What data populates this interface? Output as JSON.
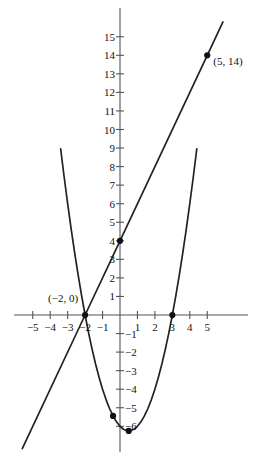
{
  "figure": {
    "kind": "cartesian-graph",
    "background_color": "#ffffff",
    "ink_color": "#222222",
    "axis_color": "#555555"
  },
  "axes": {
    "x_label": "",
    "y_label": "",
    "xlim": [
      -6.3,
      6.3
    ],
    "ylim": [
      -7.6,
      16.5
    ],
    "grid": false,
    "x_ticks": [
      -5,
      -4,
      -3,
      -2,
      -1,
      1,
      2,
      3,
      4,
      5
    ],
    "x_tick_labels": [
      "−5",
      "−4",
      "−3",
      "−2",
      "−1",
      "1",
      "2",
      "3",
      "4",
      "5"
    ],
    "y_ticks": [
      15,
      14,
      13,
      12,
      11,
      10,
      9,
      8,
      7,
      6,
      5,
      4,
      3,
      2,
      1,
      -1,
      -2,
      -3,
      -4,
      -5,
      -6
    ],
    "y_tick_labels": [
      "15",
      "14",
      "13",
      "12",
      "11",
      "10",
      "9",
      "8",
      "7",
      "6",
      "5",
      "4",
      "3",
      "2",
      "1",
      "−1",
      "−2",
      "−3",
      "−4",
      "−5",
      "−6"
    ],
    "origin_px": {
      "x": 120,
      "y": 315
    },
    "px_per_unit": {
      "x": 17.45,
      "y": 18.55
    }
  },
  "chart_data": {
    "type": "line",
    "title": "",
    "xlabel": "",
    "ylabel": "",
    "xlim": [
      -6.3,
      6.3
    ],
    "ylim": [
      -7.6,
      16.5
    ],
    "grid": false,
    "legend": "none",
    "series": [
      {
        "name": "parabola",
        "equation": "y = x^2 - x - 6",
        "kind": "quadratic",
        "coefficients": {
          "a": 1,
          "b": -1,
          "c": -6
        },
        "vertex": [
          0.5,
          -6.25
        ],
        "x_intercepts": [
          -2,
          3
        ],
        "y_intercept": -6,
        "x_domain": [
          -3.4,
          4.4
        ],
        "points": [
          [
            -3.4,
            8.96
          ],
          [
            -3.2,
            7.44
          ],
          [
            -3.0,
            6.0
          ],
          [
            -2.8,
            4.64
          ],
          [
            -2.6,
            3.36
          ],
          [
            -2.4,
            2.16
          ],
          [
            -2.2,
            1.04
          ],
          [
            -2.0,
            0.0
          ],
          [
            -1.8,
            -0.96
          ],
          [
            -1.6,
            -1.84
          ],
          [
            -1.4,
            -2.64
          ],
          [
            -1.2,
            -3.36
          ],
          [
            -1.0,
            -4.0
          ],
          [
            -0.8,
            -4.56
          ],
          [
            -0.6,
            -5.04
          ],
          [
            -0.4,
            -5.44
          ],
          [
            -0.2,
            -5.76
          ],
          [
            0.0,
            -6.0
          ],
          [
            0.2,
            -6.16
          ],
          [
            0.4,
            -6.24
          ],
          [
            0.5,
            -6.25
          ],
          [
            0.6,
            -6.24
          ],
          [
            0.8,
            -6.16
          ],
          [
            1.0,
            -6.0
          ],
          [
            1.2,
            -5.76
          ],
          [
            1.4,
            -5.44
          ],
          [
            1.6,
            -5.04
          ],
          [
            1.8,
            -4.56
          ],
          [
            2.0,
            -4.0
          ],
          [
            2.2,
            -3.36
          ],
          [
            2.4,
            -2.64
          ],
          [
            2.6,
            -1.84
          ],
          [
            2.8,
            -0.96
          ],
          [
            3.0,
            0.0
          ],
          [
            3.2,
            1.04
          ],
          [
            3.4,
            2.16
          ],
          [
            3.6,
            3.36
          ],
          [
            3.8,
            4.64
          ],
          [
            4.0,
            6.0
          ],
          [
            4.2,
            7.44
          ],
          [
            4.4,
            8.96
          ]
        ]
      },
      {
        "name": "line",
        "equation": "y = 2x + 4",
        "kind": "linear",
        "slope": 2,
        "y_intercept": 4,
        "x_intercept": -2,
        "x_domain": [
          -5.6,
          5.9
        ],
        "points": [
          [
            -5.6,
            -7.2
          ],
          [
            -2.0,
            0.0
          ],
          [
            0.0,
            4.0
          ],
          [
            5.0,
            14.0
          ],
          [
            5.9,
            15.8
          ]
        ]
      }
    ],
    "intersections": [
      {
        "label": "(−2, 0)",
        "x": -2,
        "y": 0
      },
      {
        "label": "(5, 14)",
        "x": 5,
        "y": 14
      }
    ],
    "marked_points": [
      {
        "name": "intersection-left",
        "x": -2,
        "y": 0,
        "label": "(−2, 0)"
      },
      {
        "name": "intersection-right",
        "x": 5,
        "y": 14,
        "label": "(5, 14)"
      },
      {
        "name": "line-y-intercept",
        "x": 0,
        "y": 4,
        "label": ""
      },
      {
        "name": "parabola-x-intercept-right",
        "x": 3,
        "y": 0,
        "label": ""
      },
      {
        "name": "parabola-point-left-of-vertex",
        "x": -0.4,
        "y": -5.44,
        "label": ""
      },
      {
        "name": "parabola-vertex",
        "x": 0.5,
        "y": -6.25,
        "label": ""
      }
    ]
  },
  "annotations": {
    "left_point_label": "(−2, 0)",
    "right_point_label": "(5, 14)"
  }
}
